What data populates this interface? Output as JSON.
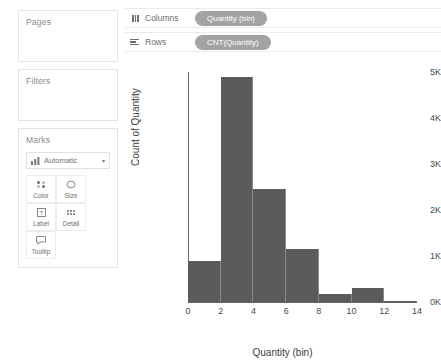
{
  "sidebar": {
    "pages": {
      "title": "Pages"
    },
    "filters": {
      "title": "Filters"
    },
    "marks": {
      "title": "Marks",
      "mark_type": "Automatic",
      "chevron": "▾",
      "buttons": [
        {
          "label": "Color",
          "icon": "color-icon"
        },
        {
          "label": "Size",
          "icon": "size-icon"
        },
        {
          "label": "Label",
          "icon": "label-icon"
        },
        {
          "label": "Detail",
          "icon": "detail-icon"
        },
        {
          "label": "Tooltip",
          "icon": "tooltip-icon"
        }
      ]
    }
  },
  "shelves": {
    "columns": {
      "name": "Columns",
      "pill": "Quantity (bin)"
    },
    "rows": {
      "name": "Rows",
      "pill": "CNT(Quantity)"
    }
  },
  "colors": {
    "bar": "#5b5b5b",
    "pill": "#a3a3a3",
    "card_border": "#e4e4e4"
  },
  "chart_data": {
    "type": "bar",
    "title": "",
    "xlabel": "Quantity (bin)",
    "ylabel": "Count of Quantity",
    "grid": false,
    "legend": "none",
    "xlim": [
      0,
      14
    ],
    "ylim": [
      0,
      5000
    ],
    "xticks": [
      0,
      2,
      4,
      6,
      8,
      10,
      12,
      14
    ],
    "xtick_labels": [
      "0",
      "2",
      "4",
      "6",
      "8",
      "10",
      "12",
      "14"
    ],
    "yticks": [
      0,
      1000,
      2000,
      3000,
      4000,
      5000
    ],
    "ytick_labels": [
      "0K",
      "1K",
      "2K",
      "3K",
      "4K",
      "5K"
    ],
    "bin_width": 2,
    "bins": [
      {
        "start": 0,
        "end": 2,
        "label": "0",
        "value": 900
      },
      {
        "start": 2,
        "end": 4,
        "label": "2",
        "value": 4900
      },
      {
        "start": 4,
        "end": 6,
        "label": "4",
        "value": 2450
      },
      {
        "start": 6,
        "end": 8,
        "label": "6",
        "value": 1150
      },
      {
        "start": 8,
        "end": 10,
        "label": "8",
        "value": 180
      },
      {
        "start": 10,
        "end": 12,
        "label": "10",
        "value": 300
      },
      {
        "start": 12,
        "end": 14,
        "label": "12",
        "value": 20
      }
    ],
    "categories": [
      "0",
      "2",
      "4",
      "6",
      "8",
      "10",
      "12"
    ],
    "values": [
      900,
      4900,
      2450,
      1150,
      180,
      300,
      20
    ]
  }
}
